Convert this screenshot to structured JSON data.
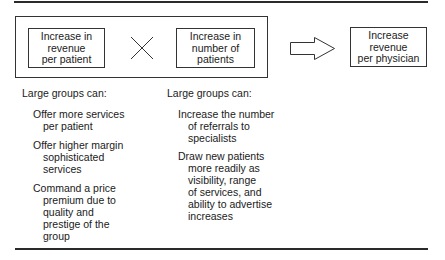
{
  "equation": {
    "factor_left": [
      "Increase in",
      "revenue",
      "per patient"
    ],
    "operator": "multiply-icon",
    "factor_right": [
      "Increase in",
      "number of",
      "patients"
    ],
    "implies": "arrow-right-icon",
    "result": [
      "Increase",
      "revenue",
      "per physician"
    ]
  },
  "columns": [
    {
      "heading": "Large groups can:",
      "items": [
        [
          "Offer more services",
          "per patient"
        ],
        [
          "Offer higher margin",
          "sophisticated",
          "services"
        ],
        [
          "Command a price",
          "premium due to",
          "quality and",
          "prestige of the",
          "group"
        ]
      ]
    },
    {
      "heading": "Large groups can:",
      "items": [
        [
          "Increase the number",
          "of referrals to",
          "specialists"
        ],
        [
          "Draw new patients",
          "more readily as",
          "visibility, range",
          "of services, and",
          "ability to advertise",
          "increases"
        ]
      ]
    }
  ]
}
